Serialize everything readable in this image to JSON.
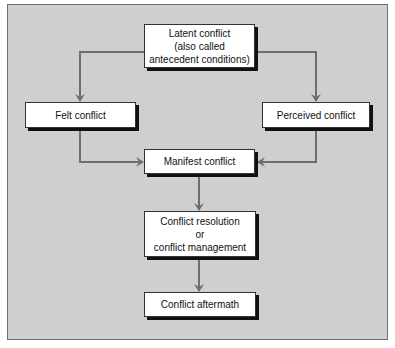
{
  "diagram": {
    "nodes": {
      "latent": "Latent conflict\n(also called\nantecedent conditions)",
      "felt": "Felt conflict",
      "perceived": "Perceived conflict",
      "manifest": "Manifest conflict",
      "resolution": "Conflict resolution\nor\nconflict management",
      "aftermath": "Conflict aftermath"
    },
    "edges": [
      {
        "from": "latent",
        "to": "felt"
      },
      {
        "from": "latent",
        "to": "perceived"
      },
      {
        "from": "felt",
        "to": "manifest"
      },
      {
        "from": "perceived",
        "to": "manifest"
      },
      {
        "from": "manifest",
        "to": "resolution"
      },
      {
        "from": "resolution",
        "to": "aftermath"
      }
    ],
    "colors": {
      "background": "#cfcfcf",
      "box": "#ffffff",
      "arrow": "#6e6e6e"
    }
  }
}
